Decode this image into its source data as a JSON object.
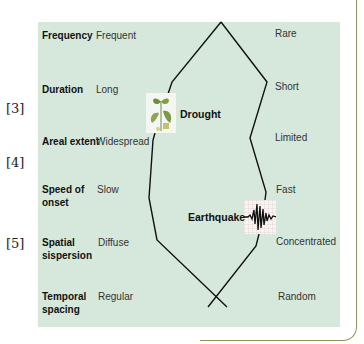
{
  "refs": [
    "[3]",
    "[4]",
    "[5]"
  ],
  "rows": [
    {
      "label": "Frequency",
      "left": "Frequent",
      "right": "Rare"
    },
    {
      "label": "Duration",
      "left": "Long",
      "right": "Short"
    },
    {
      "label": "Areal extent",
      "left": "Widespread",
      "right": "Limited"
    },
    {
      "label": "Speed of onset",
      "label_l1": "Speed of",
      "label_l2": "onset",
      "left": "Slow",
      "right": "Fast"
    },
    {
      "label": "Spatial sispersion",
      "label_l1": "Spatial",
      "label_l2": "sispersion",
      "left": "Diffuse",
      "right": "Concentrated"
    },
    {
      "label": "Temporal spacing",
      "label_l1": "Temporal",
      "label_l2": "spacing",
      "left": "Regular",
      "right": "Random"
    }
  ],
  "hazards": {
    "drought": {
      "label": "Drought",
      "icon": "plant-seedling-icon"
    },
    "earthquake": {
      "label": "Earthquake",
      "icon": "seismograph-icon"
    }
  },
  "colors": {
    "panel": "#d6e8dc",
    "line": "#111111",
    "frame": "#8a9660"
  }
}
